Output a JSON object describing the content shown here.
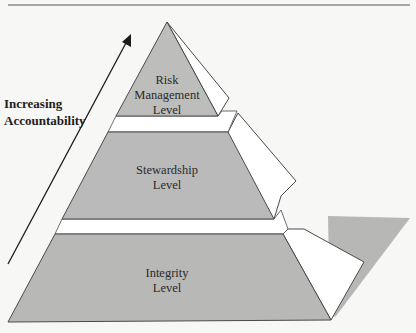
{
  "diagram": {
    "type": "pyramid",
    "caption_rule_visible": true,
    "axis": {
      "label_lines": [
        "Increasing",
        "Accountability"
      ],
      "direction": "up"
    },
    "tiers": [
      {
        "order": "top",
        "label_lines": [
          "Risk",
          "Management",
          "Level"
        ]
      },
      {
        "order": "middle",
        "label_lines": [
          "Stewardship",
          "Level"
        ]
      },
      {
        "order": "bottom",
        "label_lines": [
          "Integrity",
          "Level"
        ]
      }
    ],
    "colors": {
      "face": "#b9b9b7",
      "side": "#ffffff",
      "shadow": "#b5b5b3",
      "outline": "#4a4a4a",
      "background": "#f7f7f5"
    }
  }
}
